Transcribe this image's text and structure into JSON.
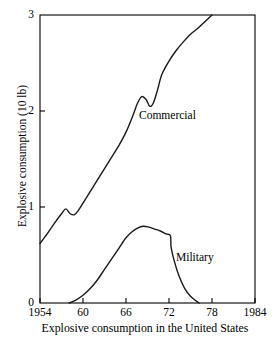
{
  "figure": {
    "caption": "Explosive consumption in the United States",
    "y_axis_title": "Explosive consumption (10 lb)"
  },
  "chart_data": {
    "type": "line",
    "title": "",
    "subtitle": "",
    "xlabel": "Explosive consumption in the United States",
    "ylabel": "Explosive consumption (10 lb)",
    "xlim": [
      1954,
      1984
    ],
    "ylim": [
      0,
      3
    ],
    "grid": false,
    "legend_position": "inline-annotation",
    "x_tick_labels": [
      "1954",
      "60",
      "66",
      "72",
      "78",
      "1984"
    ],
    "x_tick_values": [
      1954,
      1960,
      1966,
      1972,
      1978,
      1984
    ],
    "y_tick_labels": [
      "0",
      "1",
      "2",
      "3"
    ],
    "y_tick_values": [
      0,
      1,
      2,
      3
    ],
    "annotations": [
      {
        "text": "Commercial",
        "x": 1968.0,
        "y": 1.97
      },
      {
        "text": "Military",
        "x": 1973.5,
        "y": 0.5
      }
    ],
    "series": [
      {
        "name": "Commercial",
        "x": [
          1954,
          1955,
          1956,
          1957,
          1957.6,
          1958.2,
          1958.8,
          1959.4,
          1960,
          1961,
          1962,
          1963,
          1964,
          1965,
          1966,
          1967,
          1967.6,
          1968.2,
          1968.8,
          1969.3,
          1969.8,
          1970.4,
          1971,
          1972,
          1973,
          1974,
          1975,
          1976,
          1977,
          1978
        ],
        "y": [
          0.62,
          0.72,
          0.83,
          0.93,
          0.98,
          0.93,
          0.92,
          0.97,
          1.04,
          1.16,
          1.28,
          1.4,
          1.52,
          1.64,
          1.78,
          1.96,
          2.08,
          2.15,
          2.12,
          2.05,
          2.08,
          2.22,
          2.38,
          2.52,
          2.63,
          2.72,
          2.8,
          2.86,
          2.93,
          3.0
        ]
      },
      {
        "name": "Military",
        "x": [
          1958.1,
          1959,
          1960,
          1961,
          1962,
          1963,
          1964,
          1965,
          1966,
          1966.8,
          1967.6,
          1968.4,
          1969.2,
          1970,
          1970.8,
          1971.6,
          1972.2,
          1972.3,
          1972.8,
          1973.4,
          1974.2,
          1975,
          1975.8,
          1976.2
        ],
        "y": [
          0.0,
          0.03,
          0.08,
          0.15,
          0.24,
          0.35,
          0.46,
          0.57,
          0.68,
          0.74,
          0.78,
          0.8,
          0.79,
          0.77,
          0.75,
          0.72,
          0.7,
          0.58,
          0.42,
          0.28,
          0.15,
          0.07,
          0.02,
          0.0
        ]
      }
    ]
  },
  "colors": {
    "axis": "#000000",
    "curve": "#1a1a1a",
    "background": "#ffffff"
  },
  "geometry": {
    "plot_left": 40,
    "plot_right": 255,
    "plot_top": 15,
    "plot_bottom": 303
  }
}
